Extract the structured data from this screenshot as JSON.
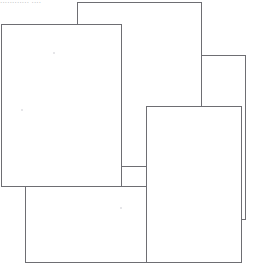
{
  "document": {
    "title": "Scanned overlapping blank pages",
    "background_color": "#ffffff",
    "outline_color": "#6e6e73",
    "width": 261,
    "height": 270,
    "header_text": "............ ....",
    "header_text_color": "#a9a9ad",
    "page_count": 5
  },
  "pages": [
    {
      "id": "page-top-middle",
      "label": "Top middle sheet",
      "x": 77,
      "y": 2,
      "width": 125,
      "height": 165,
      "z": 1
    },
    {
      "id": "page-right",
      "label": "Right sheet",
      "x": 201,
      "y": 55,
      "width": 45,
      "height": 165,
      "z": 2
    },
    {
      "id": "page-bottom-middle",
      "label": "Bottom middle sheet",
      "x": 146,
      "y": 106,
      "width": 96,
      "height": 157,
      "z": 3
    },
    {
      "id": "page-bottom-left",
      "label": "Bottom left sheet",
      "x": 25,
      "y": 186,
      "width": 122,
      "height": 77,
      "z": 4
    },
    {
      "id": "page-left",
      "label": "Large left sheet",
      "x": 1,
      "y": 24,
      "width": 121,
      "height": 163,
      "z": 5
    }
  ],
  "specks": [
    {
      "x": 53,
      "y": 52
    },
    {
      "x": 21,
      "y": 109
    },
    {
      "x": 120,
      "y": 207
    }
  ]
}
